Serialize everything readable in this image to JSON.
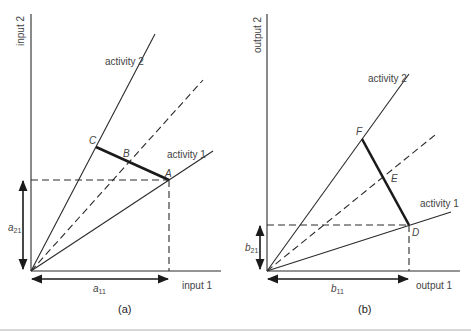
{
  "figure": {
    "panel_a": {
      "caption": "(a)",
      "y_axis_label": "input 2",
      "x_axis_label": "input 1",
      "rays": [
        {
          "label": "activity 2"
        },
        {
          "label": "activity 1"
        }
      ],
      "points": {
        "A": "A",
        "B": "B",
        "C": "C"
      },
      "dim_vertical": {
        "base": "a",
        "sub": "21"
      },
      "dim_horizontal": {
        "base": "a",
        "sub": "11"
      }
    },
    "panel_b": {
      "caption": "(b)",
      "y_axis_label": "output 2",
      "x_axis_label": "output 1",
      "rays": [
        {
          "label": "activity 2"
        },
        {
          "label": "activity 1"
        }
      ],
      "points": {
        "D": "D",
        "E": "E",
        "F": "F"
      },
      "dim_vertical": {
        "base": "b",
        "sub": "21"
      },
      "dim_horizontal": {
        "base": "b",
        "sub": "11"
      }
    }
  }
}
